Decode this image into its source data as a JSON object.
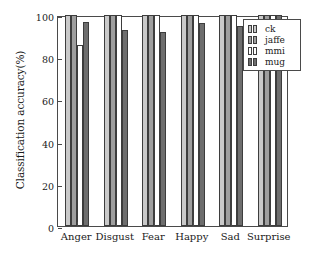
{
  "chart_data": {
    "type": "bar",
    "title": "",
    "xlabel": "",
    "ylabel": "Classification accuracy(%)",
    "ylim": [
      0,
      100
    ],
    "yticks": [
      0,
      20,
      40,
      60,
      80,
      100
    ],
    "ytick_labels": [
      "0",
      "20",
      "40",
      "60",
      "80",
      "100"
    ],
    "grid": false,
    "legend_position": "upper-right",
    "categories": [
      "Anger",
      "Disgust",
      "Fear",
      "Happy",
      "Sad",
      "Surprise"
    ],
    "series": [
      {
        "name": "ck",
        "color": "#c9c9c9",
        "values": [
          100,
          100,
          100,
          100,
          100,
          100
        ]
      },
      {
        "name": "jaffe",
        "color": "#9e9e9e",
        "values": [
          100,
          100,
          100,
          100,
          100,
          100
        ]
      },
      {
        "name": "mmi",
        "color": "#ffffff",
        "values": [
          86,
          100,
          100,
          100,
          100,
          100
        ]
      },
      {
        "name": "mug",
        "color": "#6e6e6e",
        "values": [
          96.5,
          93,
          92,
          96,
          95,
          100
        ]
      }
    ]
  },
  "legend": {
    "entries": [
      {
        "label": "ck"
      },
      {
        "label": "jaffe"
      },
      {
        "label": "mmi"
      },
      {
        "label": "mug"
      }
    ]
  }
}
